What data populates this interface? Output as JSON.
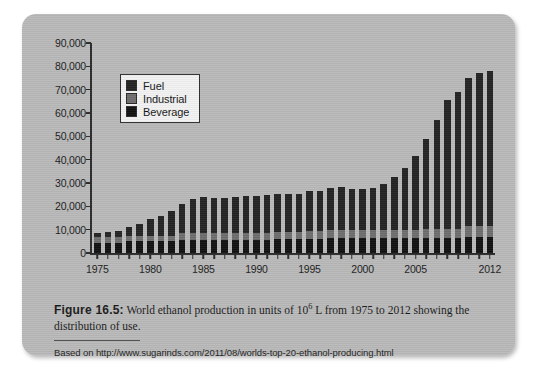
{
  "figure": {
    "panel_background": "#b9b9b9",
    "caption_label": "Figure 16.5:",
    "caption_text_before": " World ethanol production in units of 10",
    "caption_exponent": "6",
    "caption_text_after": " L from 1975 to 2012 showing the distribution of use.",
    "source_line": "Based on http://www.sugarinds.com/2011/08/worlds-top-20-ethanol-producing.html"
  },
  "chart_data": {
    "type": "bar",
    "stacked": true,
    "title": "",
    "xlabel": "",
    "ylabel": "",
    "ylim": [
      0,
      90000
    ],
    "ytick_step": 10000,
    "ytick_labels": [
      "90,000",
      "80,000",
      "70,000",
      "60,000",
      "50,000",
      "40,000",
      "30,000",
      "20,000",
      "10,000",
      "0"
    ],
    "ytick_values": [
      90000,
      80000,
      70000,
      60000,
      50000,
      40000,
      30000,
      20000,
      10000,
      0
    ],
    "grid": false,
    "legend_position": "top-left",
    "legend": [
      "Fuel",
      "Industrial",
      "Beverage"
    ],
    "colors": {
      "Fuel": "#232323",
      "Industrial": "#6e6e6e",
      "Beverage": "#111111"
    },
    "categories": [
      1975,
      1976,
      1977,
      1978,
      1979,
      1980,
      1981,
      1982,
      1983,
      1984,
      1985,
      1986,
      1987,
      1988,
      1989,
      1990,
      1991,
      1992,
      1993,
      1994,
      1995,
      1996,
      1997,
      1998,
      1999,
      2000,
      2001,
      2002,
      2003,
      2004,
      2005,
      2006,
      2007,
      2008,
      2009,
      2010,
      2011,
      2012
    ],
    "xtick_labels": [
      "1975",
      "1980",
      "1985",
      "1990",
      "1995",
      "2000",
      "2005",
      "2012"
    ],
    "xtick_categories": [
      1975,
      1980,
      1985,
      1990,
      1995,
      2000,
      2005,
      2012
    ],
    "series": [
      {
        "name": "Fuel",
        "values": [
          1500,
          2000,
          2500,
          3500,
          5000,
          7000,
          8500,
          10500,
          12500,
          14500,
          15500,
          15000,
          15000,
          15500,
          16000,
          16000,
          16500,
          16500,
          16500,
          16500,
          17000,
          17000,
          18000,
          18500,
          17500,
          17500,
          18000,
          19500,
          22500,
          26500,
          31500,
          38500,
          46500,
          55000,
          58500,
          63500,
          65500,
          66500
        ]
      },
      {
        "name": "Industrial",
        "values": [
          2500,
          2500,
          2500,
          2500,
          2500,
          2500,
          2500,
          2500,
          3000,
          3000,
          3000,
          3000,
          3000,
          3000,
          3000,
          3000,
          3000,
          3000,
          3000,
          3000,
          3500,
          3500,
          3500,
          3500,
          3500,
          3500,
          3500,
          3500,
          3500,
          3500,
          3500,
          4000,
          4000,
          4000,
          4000,
          4500,
          4500,
          4500
        ]
      },
      {
        "name": "Beverage",
        "values": [
          4500,
          4500,
          4500,
          5000,
          5000,
          5000,
          5000,
          5000,
          5500,
          5500,
          5500,
          5500,
          5500,
          5500,
          5500,
          5500,
          5500,
          6000,
          6000,
          6000,
          6000,
          6000,
          6500,
          6500,
          6500,
          6500,
          6500,
          6500,
          6500,
          6500,
          6500,
          6500,
          6500,
          6500,
          6500,
          7000,
          7000,
          7000
        ]
      }
    ],
    "totals": [
      8500,
      9000,
      9500,
      11000,
      12500,
      14500,
      16000,
      18000,
      21000,
      23000,
      24000,
      23500,
      23500,
      24000,
      24500,
      24500,
      25000,
      25500,
      25500,
      25500,
      26500,
      26500,
      28000,
      28500,
      27500,
      27500,
      28000,
      29500,
      32500,
      36500,
      41500,
      49000,
      57000,
      65500,
      69000,
      75000,
      77000,
      78000
    ]
  }
}
